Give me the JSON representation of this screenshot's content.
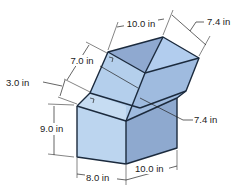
{
  "figure": {
    "colors": {
      "face_light": "#bcd5ef",
      "face_mid": "#a6c2e3",
      "face_dark": "#8ea9cf",
      "face_top": "#9fb6d8",
      "edge": "#1b2a3d"
    }
  },
  "dimensions": {
    "top_width": "10.0 in",
    "top_depth": "7.4 in",
    "upper_slant": "7.0 in",
    "small_offset": "3.0 in",
    "diagonal": "7.4 in",
    "lower_height": "9.0 in",
    "bottom_left": "8.0 in",
    "bottom_right": "10.0 in"
  }
}
